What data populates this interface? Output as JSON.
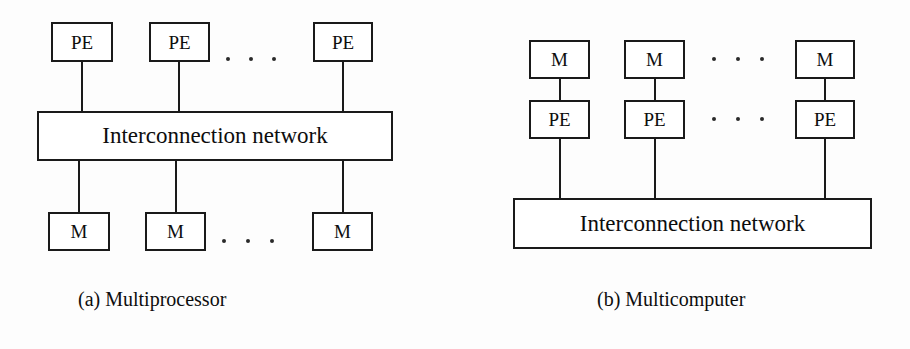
{
  "figure": {
    "background": "#fdfdfd",
    "line_color": "#1a1a1a",
    "text_color": "#0d0d0d",
    "width": 910,
    "height": 349
  },
  "panel_a": {
    "caption": "(a) Multiprocessor",
    "network_label": "Interconnection network",
    "top_row_label": "PE",
    "bottom_row_label": "M",
    "top_nodes": [
      {
        "label": "PE",
        "x": 51,
        "y": 22,
        "w": 62,
        "h": 40
      },
      {
        "label": "PE",
        "x": 149,
        "y": 22,
        "w": 61,
        "h": 40
      },
      {
        "label": "PE",
        "x": 313,
        "y": 22,
        "w": 60,
        "h": 40
      }
    ],
    "bottom_nodes": [
      {
        "label": "M",
        "x": 48,
        "y": 212,
        "w": 62,
        "h": 39
      },
      {
        "label": "M",
        "x": 145,
        "y": 212,
        "w": 61,
        "h": 39
      },
      {
        "label": "M",
        "x": 312,
        "y": 212,
        "w": 61,
        "h": 39
      }
    ],
    "network_box": {
      "x": 37,
      "y": 111,
      "w": 356,
      "h": 50
    },
    "ellipsis_top": {
      "x": 226,
      "y": 56,
      "count": 3
    },
    "ellipsis_bottom": {
      "x": 222,
      "y": 240,
      "count": 3
    },
    "caption_pos": {
      "x": 78,
      "y": 288
    }
  },
  "panel_b": {
    "caption": "(b) Multicomputer",
    "network_label": "Interconnection network",
    "top_row_label": "M",
    "middle_row_label": "PE",
    "top_nodes": [
      {
        "label": "M",
        "x": 529,
        "y": 40,
        "w": 61,
        "h": 39
      },
      {
        "label": "M",
        "x": 624,
        "y": 40,
        "w": 61,
        "h": 39
      },
      {
        "label": "M",
        "x": 795,
        "y": 40,
        "w": 60,
        "h": 39
      }
    ],
    "middle_nodes": [
      {
        "label": "PE",
        "x": 529,
        "y": 100,
        "w": 61,
        "h": 39
      },
      {
        "label": "PE",
        "x": 624,
        "y": 100,
        "w": 61,
        "h": 39
      },
      {
        "label": "PE",
        "x": 795,
        "y": 100,
        "w": 60,
        "h": 39
      }
    ],
    "network_box": {
      "x": 513,
      "y": 198,
      "w": 359,
      "h": 51
    },
    "ellipsis_top": {
      "x": 712,
      "y": 58,
      "count": 3
    },
    "ellipsis_middle": {
      "x": 712,
      "y": 118,
      "count": 3
    },
    "caption_pos": {
      "x": 597,
      "y": 288
    }
  }
}
